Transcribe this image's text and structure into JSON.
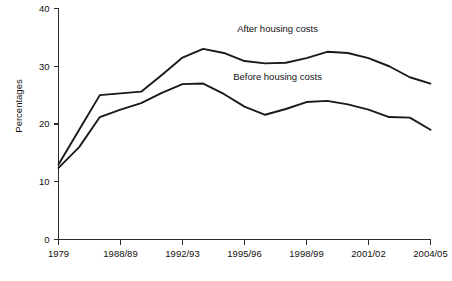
{
  "chart_data": {
    "type": "line",
    "title": "",
    "xlabel": "",
    "ylabel": "Percentages",
    "ylim": [
      0,
      40
    ],
    "yticks": [
      0,
      10,
      20,
      30,
      40
    ],
    "ytick_labels": [
      "0",
      "10",
      "20",
      "30",
      "40"
    ],
    "grid": false,
    "legend_position": "inline-annotation",
    "x": [
      "1979",
      "1981",
      "1987/88",
      "1988/89",
      "1990/91",
      "1991/92",
      "1992/93",
      "1993/94",
      "1994/95",
      "1995/96",
      "1996/97",
      "1997/98",
      "1998/99",
      "1999/00",
      "2000/01",
      "2001/02",
      "2002/03",
      "2003/04",
      "2004/05"
    ],
    "xticks": [
      "1979",
      "1988/89",
      "1992/93",
      "1995/96",
      "1998/99",
      "2001/02",
      "2004/05"
    ],
    "xtick_positions": [
      0,
      3,
      6,
      9,
      12,
      15,
      18
    ],
    "series": [
      {
        "name": "After housing costs",
        "annotation": "After housing costs",
        "annotation_x_index": 10.6,
        "annotation_y_value": 36.0,
        "values": [
          13.0,
          19.0,
          25.0,
          25.3,
          25.6,
          28.5,
          31.5,
          33.0,
          32.3,
          30.9,
          30.5,
          30.6,
          31.4,
          32.5,
          32.3,
          31.4,
          30.0,
          28.1,
          27.0
        ]
      },
      {
        "name": "Before housing costs",
        "annotation": "Before housing costs",
        "annotation_x_index": 10.6,
        "annotation_y_value": 27.6,
        "values": [
          12.4,
          16.0,
          21.2,
          22.5,
          23.6,
          25.4,
          26.9,
          27.0,
          25.2,
          23.0,
          21.6,
          22.6,
          23.8,
          24.0,
          23.4,
          22.5,
          21.2,
          21.1,
          19.0
        ]
      }
    ]
  },
  "axis": {
    "y_title": "Percentages"
  }
}
